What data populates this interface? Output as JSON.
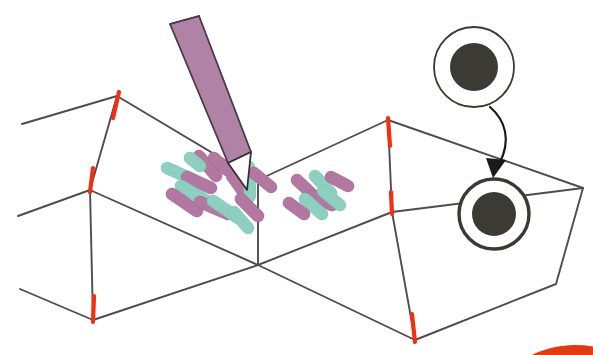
{
  "figure": {
    "kind": "scientific-illustration",
    "background_color": "#ffffff"
  },
  "palette": {
    "wireframe_line": "#514c4c",
    "edge_marker_red": "#f03010",
    "bacteria_purple": "#b379a2",
    "bacteria_purple_edge": "#a96d98",
    "bacteria_teal": "#8ed0c2",
    "bacteria_teal_edge": "#82c7b8",
    "pen_body": "#b083a6",
    "pen_body_edge": "#4a3a46",
    "pen_tip_fill": "#fdfdfd",
    "pen_tip_edge": "#3a2e36",
    "cell_ring": "#3d3833",
    "cell_nucleus": "#3c3a34",
    "arrow": "#1a1a1a",
    "corner_arc_red": "#e03b12"
  },
  "wireframe": {
    "name": "folded-3d-surface",
    "description": "Zigzag / chevron folded sheet drawn in oblique projection as two tent-like ridges",
    "stroke_width": 1.9,
    "vertices": {
      "ridge_top_left": [
        117,
        96
      ],
      "ridge_mid_left": [
        90,
        190
      ],
      "ridge_bottom_left": [
        93,
        320
      ],
      "valley_center": [
        258,
        265
      ],
      "ridge_top_right": [
        388,
        120
      ],
      "ridge_mid_right": [
        392,
        212
      ],
      "ridge_bottom_right": [
        415,
        340
      ],
      "far_right_top": [
        583,
        188
      ],
      "far_right_bottom": [
        556,
        284
      ],
      "left_edge_upper": [
        22,
        124
      ],
      "left_edge_lower": [
        18,
        216
      ],
      "left_edge_bottom": [
        20,
        289
      ]
    },
    "paths": [
      "M22,124 L117,96 L258,180 L388,120 L583,188",
      "M18,216 L90,190 L258,265 L392,212 L583,188",
      "M20,289 L93,320 L258,265",
      "M258,265 L415,340 L556,284 L583,188",
      "M117,96 L90,190",
      "M90,190 L93,320",
      "M388,120 L392,212",
      "M392,212 L415,340",
      "M258,180 L258,265"
    ]
  },
  "edge_markers": {
    "name": "red-fold-crease-markers",
    "count": 6,
    "items": [
      {
        "id": "marker-top-left",
        "x1": 119,
        "y1": 92,
        "x2": 113,
        "y2": 118
      },
      {
        "id": "marker-mid-left",
        "x1": 93,
        "y1": 168,
        "x2": 90,
        "y2": 192
      },
      {
        "id": "marker-bottom-left",
        "x1": 94,
        "y1": 296,
        "x2": 93,
        "y2": 322
      },
      {
        "id": "marker-top-right",
        "x1": 388,
        "y1": 118,
        "x2": 390,
        "y2": 146
      },
      {
        "id": "marker-mid-right",
        "x1": 391,
        "y1": 192,
        "x2": 392,
        "y2": 214
      },
      {
        "id": "marker-bottom-right",
        "x1": 412,
        "y1": 314,
        "x2": 415,
        "y2": 342
      }
    ]
  },
  "pen": {
    "name": "stylus-sampling-probe",
    "label": "pen",
    "body": "M170,24 L199,16 L251,152 L228,163 Z",
    "tip": "M228,163 L251,152 L247,190 Z",
    "cap_line": "M170,24 L199,16"
  },
  "bacteria": {
    "name": "rod-shaped-bacteria",
    "rod_width": 11,
    "left_cluster": [
      {
        "color": "purple",
        "x1": 199,
        "y1": 156,
        "x2": 216,
        "y2": 176
      },
      {
        "color": "teal",
        "x1": 167,
        "y1": 168,
        "x2": 192,
        "y2": 179
      },
      {
        "color": "purple",
        "x1": 187,
        "y1": 177,
        "x2": 211,
        "y2": 188
      },
      {
        "color": "teal",
        "x1": 181,
        "y1": 186,
        "x2": 205,
        "y2": 200
      },
      {
        "color": "purple",
        "x1": 172,
        "y1": 194,
        "x2": 197,
        "y2": 211
      },
      {
        "color": "purple",
        "x1": 200,
        "y1": 202,
        "x2": 228,
        "y2": 214
      },
      {
        "color": "teal",
        "x1": 213,
        "y1": 201,
        "x2": 238,
        "y2": 218
      },
      {
        "color": "purple",
        "x1": 232,
        "y1": 176,
        "x2": 248,
        "y2": 198
      },
      {
        "color": "teal",
        "x1": 249,
        "y1": 167,
        "x2": 250,
        "y2": 196
      },
      {
        "color": "purple",
        "x1": 254,
        "y1": 173,
        "x2": 271,
        "y2": 187
      },
      {
        "color": "purple",
        "x1": 241,
        "y1": 199,
        "x2": 258,
        "y2": 216
      },
      {
        "color": "teal",
        "x1": 234,
        "y1": 212,
        "x2": 248,
        "y2": 228
      },
      {
        "color": "purple",
        "x1": 214,
        "y1": 158,
        "x2": 227,
        "y2": 170
      },
      {
        "color": "teal",
        "x1": 190,
        "y1": 158,
        "x2": 200,
        "y2": 166
      }
    ],
    "right_cluster": [
      {
        "color": "purple",
        "x1": 297,
        "y1": 180,
        "x2": 315,
        "y2": 197
      },
      {
        "color": "teal",
        "x1": 315,
        "y1": 176,
        "x2": 331,
        "y2": 193
      },
      {
        "color": "purple",
        "x1": 331,
        "y1": 177,
        "x2": 348,
        "y2": 186
      },
      {
        "color": "purple",
        "x1": 313,
        "y1": 196,
        "x2": 332,
        "y2": 205
      },
      {
        "color": "teal",
        "x1": 305,
        "y1": 199,
        "x2": 322,
        "y2": 214
      },
      {
        "color": "purple",
        "x1": 289,
        "y1": 203,
        "x2": 304,
        "y2": 214
      },
      {
        "color": "teal",
        "x1": 323,
        "y1": 191,
        "x2": 340,
        "y2": 205
      }
    ]
  },
  "cells": [
    {
      "id": "magnified-cell-inset",
      "name": "magnified-bacterium-inset",
      "cx": 474,
      "cy": 67,
      "ring_r": 40,
      "ring_width": 1.8,
      "nucleus_r": 24
    },
    {
      "id": "surface-cell",
      "name": "surface-bacterium",
      "cx": 494,
      "cy": 214,
      "ring_r": 35,
      "ring_width": 3.4,
      "nucleus_r": 22
    }
  ],
  "arrow": {
    "name": "magnification-arrow",
    "path": "M490,107 C505,120 512,140 499,164",
    "head": "M493,178 L486,158 L506,160 Z",
    "stroke_width": 2.2
  },
  "corner_arc": {
    "name": "cropped-red-arc",
    "path": "M520,372 A60,34 0 0 1 593,352",
    "stroke": "#e03b12",
    "stroke_width": 11
  }
}
